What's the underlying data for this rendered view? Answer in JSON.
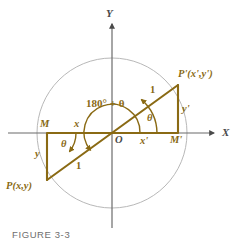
{
  "figure": {
    "caption": "FIGURE 3-3",
    "colors": {
      "curve": "#8a6a14",
      "axis": "#6b6b6b",
      "circle": "#b8b8b8",
      "caption": "#6e6e6e"
    },
    "axes": {
      "x_label": "X",
      "y_label": "Y",
      "origin_label": "O"
    },
    "points": {
      "p_label": "P(x,y)",
      "p_prime_label": "P'(x',y')",
      "m_label": "M",
      "m_prime_label": "M'"
    },
    "segments": {
      "x_label": "x",
      "y_label": "y",
      "x_prime_label": "x'",
      "y_prime_label": "y'",
      "radius_lower_label": "1",
      "radius_upper_label": "1"
    },
    "angles": {
      "theta_upper_label": "θ",
      "theta_lower_label": "θ",
      "reflex_label": "180° + θ"
    }
  }
}
